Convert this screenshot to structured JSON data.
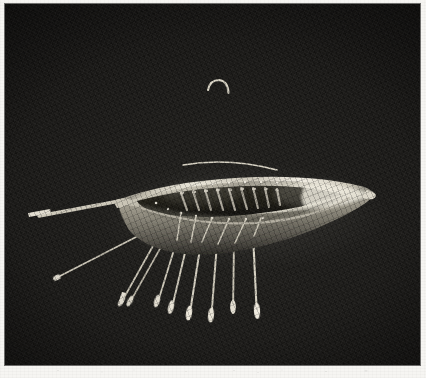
{
  "page": {
    "background_color": "#f6f5f2",
    "margin_color": "#f6f5f2"
  },
  "plate": {
    "name": "photographic-plate",
    "caption": "",
    "background_color": "#1c1b19",
    "frame": {
      "x": 5,
      "y": 4,
      "width": 415,
      "height": 361
    },
    "medium": "monochrome photograph",
    "subject_label": "gold model boat with mast, yard and oars"
  },
  "artifact": {
    "name": "gold-model-boat",
    "metal_color": "#cfcabc",
    "metal_shadow_color": "#6b675e",
    "metal_highlight_color": "#ece8dc",
    "parts": {
      "hull": {
        "label": "hull",
        "fill": "#b8b2a4",
        "bow_x": 113,
        "stern_x": 368,
        "sheer_y": 196,
        "keel_y": 250
      },
      "mast": {
        "label": "mast",
        "top_y": 76,
        "base_y": 188,
        "x": 223,
        "hooked_top": true
      },
      "yard": {
        "label": "yard-arm",
        "left_x": 178,
        "right_x": 272,
        "y": 160
      },
      "steering_oar": {
        "label": "steering-oar",
        "blade_x": 24,
        "blade_y": 207
      },
      "thwarts": {
        "label": "thwarts",
        "count": 9
      },
      "oars": {
        "label": "oars",
        "count": 9,
        "blade_shape": "spatulate"
      }
    }
  },
  "accessibility": {
    "alt_text": "Monochrome photograph of a small gold model boat with a central hooked mast, a crossing yard-arm, interior thwarts and nine oars with spatulate blades projecting downward, set against a black background on a white page."
  }
}
